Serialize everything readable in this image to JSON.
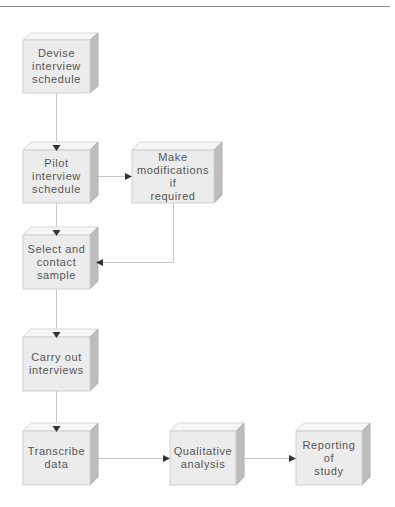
{
  "diagram": {
    "type": "flowchart",
    "colors": {
      "front": "#ececec",
      "top": "#f6f6f6",
      "side": "#bdbdbd",
      "border": "#d0d0d0",
      "connector": "#c8c8c8",
      "arrowhead": "#333333",
      "text": "#555555"
    },
    "nodes": [
      {
        "id": "devise",
        "label": "Devise\ninterview\nschedule",
        "x": 23,
        "y": 40,
        "w": 67,
        "h": 53
      },
      {
        "id": "pilot",
        "label": "Pilot\ninterview\nschedule",
        "x": 23,
        "y": 150,
        "w": 67,
        "h": 53
      },
      {
        "id": "modify",
        "label": "Make\nmodifications if\nrequired",
        "x": 132,
        "y": 150,
        "w": 82,
        "h": 53
      },
      {
        "id": "select",
        "label": "Select and\ncontact\nsample",
        "x": 23,
        "y": 235,
        "w": 67,
        "h": 54
      },
      {
        "id": "carry",
        "label": "Carry out\ninterviews",
        "x": 23,
        "y": 337,
        "w": 67,
        "h": 54
      },
      {
        "id": "transcribe",
        "label": "Transcribe\ndata",
        "x": 23,
        "y": 431,
        "w": 67,
        "h": 54
      },
      {
        "id": "qualitative",
        "label": "Qualitative\nanalysis",
        "x": 170,
        "y": 431,
        "w": 66,
        "h": 54
      },
      {
        "id": "reporting",
        "label": "Reporting of\nstudy",
        "x": 296,
        "y": 431,
        "w": 66,
        "h": 54
      }
    ],
    "edges": [
      {
        "from": "devise",
        "to": "pilot"
      },
      {
        "from": "pilot",
        "to": "modify"
      },
      {
        "from": "pilot",
        "to": "select"
      },
      {
        "from": "modify",
        "to": "select"
      },
      {
        "from": "select",
        "to": "carry"
      },
      {
        "from": "carry",
        "to": "transcribe"
      },
      {
        "from": "transcribe",
        "to": "qualitative"
      },
      {
        "from": "qualitative",
        "to": "reporting"
      }
    ]
  }
}
